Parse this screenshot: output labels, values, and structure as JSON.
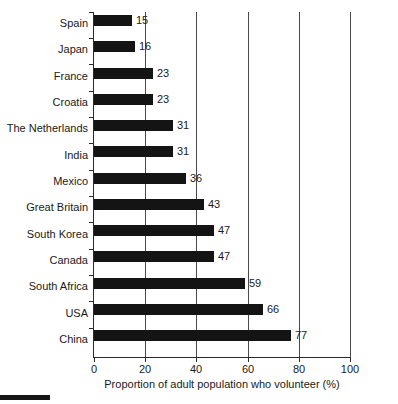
{
  "chart_data": {
    "type": "bar",
    "orientation": "horizontal",
    "title": "",
    "xlabel": "Proportion of adult population who volunteer (%)",
    "ylabel": "",
    "xlim": [
      0,
      100
    ],
    "xticks": [
      0,
      20,
      40,
      60,
      80,
      100
    ],
    "xtick_labels": [
      "0",
      "20",
      "40",
      "60",
      "80",
      "100"
    ],
    "grid": "vertical",
    "legend": "none",
    "bar_color": "#141414",
    "gridline_color": "#4a4a4a",
    "axis_color": "#2b2b2b",
    "background_color": "#ffffff",
    "value_labels": true,
    "categories": [
      "Spain",
      "Japan",
      "France",
      "Croatia",
      "The Netherlands",
      "India",
      "Mexico",
      "Great Britain",
      "South Korea",
      "Canada",
      "South Africa",
      "USA",
      "China"
    ],
    "values": [
      15,
      16,
      23,
      23,
      31,
      31,
      36,
      43,
      47,
      47,
      59,
      66,
      77
    ]
  }
}
